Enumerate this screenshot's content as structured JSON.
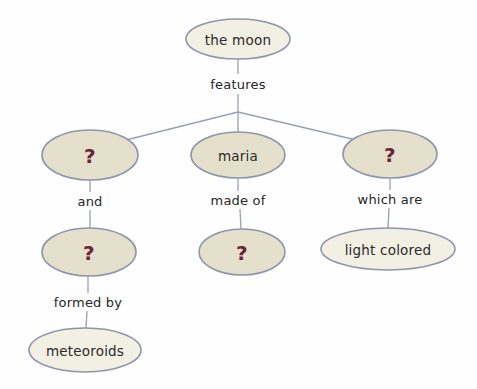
{
  "diagram": {
    "type": "concept-map",
    "background_color": "#fefefe",
    "node_fill_beige": "#e4e0cb",
    "node_fill_cream": "#f2efe3",
    "node_border_color": "#8d96ad",
    "link_color": "#97a0b4",
    "text_color": "#2b2b2b",
    "unknown_marker_color": "#6b2437",
    "nodes": [
      {
        "id": "moon",
        "label": "the moon",
        "kind": "concept",
        "fill": "cream",
        "cx": 238,
        "cy": 39,
        "rx": 52,
        "ry": 20
      },
      {
        "id": "left-unknown",
        "label": "?",
        "kind": "unknown",
        "fill": "beige",
        "cx": 90,
        "cy": 155,
        "rx": 48,
        "ry": 25
      },
      {
        "id": "maria",
        "label": "maria",
        "kind": "concept",
        "fill": "beige",
        "cx": 238,
        "cy": 155,
        "rx": 47,
        "ry": 23
      },
      {
        "id": "right-unknown",
        "label": "?",
        "kind": "unknown",
        "fill": "beige",
        "cx": 390,
        "cy": 154,
        "rx": 47,
        "ry": 24
      },
      {
        "id": "left-unknown-2",
        "label": "?",
        "kind": "unknown",
        "fill": "beige",
        "cx": 89,
        "cy": 252,
        "rx": 47,
        "ry": 24
      },
      {
        "id": "maria-unknown",
        "label": "?",
        "kind": "unknown",
        "fill": "beige",
        "cx": 242,
        "cy": 252,
        "rx": 43,
        "ry": 23
      },
      {
        "id": "light-colored",
        "label": "light colored",
        "kind": "concept",
        "fill": "cream",
        "cx": 388,
        "cy": 249,
        "rx": 67,
        "ry": 21
      },
      {
        "id": "meteoroids",
        "label": "meteoroids",
        "kind": "concept",
        "fill": "cream",
        "cx": 85,
        "cy": 350,
        "rx": 56,
        "ry": 22
      }
    ],
    "links": [
      {
        "id": "moon-features",
        "label": "features",
        "label_x": 238,
        "label_y": 84
      },
      {
        "id": "left-and",
        "label": "and",
        "label_x": 90,
        "label_y": 201
      },
      {
        "id": "maria-made-of",
        "label": "made of",
        "label_x": 238,
        "label_y": 200
      },
      {
        "id": "right-which-are",
        "label": "which are",
        "label_x": 390,
        "label_y": 199
      },
      {
        "id": "formed-by",
        "label": "formed by",
        "label_x": 88,
        "label_y": 302
      }
    ]
  }
}
